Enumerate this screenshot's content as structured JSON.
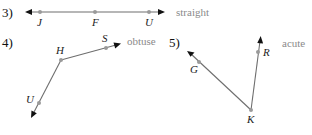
{
  "problems": [
    {
      "number": "3)",
      "answer": "straight",
      "points": [
        "J",
        "F",
        "U"
      ]
    },
    {
      "number": "4)",
      "answer": "obtuse",
      "points": [
        "H",
        "S",
        "U"
      ]
    },
    {
      "number": "5)",
      "answer": "acute",
      "points": [
        "G",
        "R",
        "K"
      ]
    }
  ],
  "colors": {
    "ray": "#6e6e6e",
    "point": "#9a9a9a",
    "answer_text": "#8a8a8a",
    "arrowhead": "#111111"
  }
}
